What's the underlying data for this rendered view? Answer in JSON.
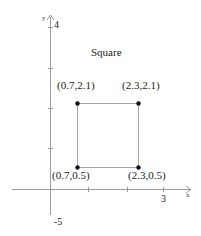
{
  "title": "Square",
  "axes": {
    "x_label": "x",
    "y_label": "y",
    "y_top_tick": "4",
    "y_bottom_tick": "-5",
    "x_tick": "3"
  },
  "points": [
    {
      "label": "(0.7,2.1)",
      "x": 0.7,
      "y": 2.1
    },
    {
      "label": "(2.3,2.1)",
      "x": 2.3,
      "y": 2.1
    },
    {
      "label": "(0.7,0.5)",
      "x": 0.7,
      "y": 0.5
    },
    {
      "label": "(2.3,0.5)",
      "x": 2.3,
      "y": 0.5
    }
  ],
  "colors": {
    "axis": "#9a9a9a",
    "square": "#a8a8a8",
    "point": "#111111"
  }
}
